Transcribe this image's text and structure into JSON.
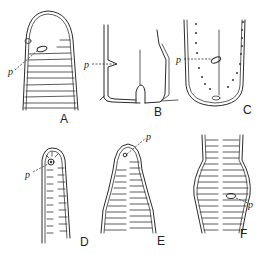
{
  "figure": {
    "panels": [
      {
        "id": "A",
        "label": "A",
        "pointer_label": "p",
        "description": "Rounded tip with transverse striations and pore p"
      },
      {
        "id": "B",
        "label": "B",
        "pointer_label": "p",
        "description": "Branching tube outline with pore p"
      },
      {
        "id": "C",
        "label": "C",
        "pointer_label": "p",
        "description": "U-shaped tip with dotted rows and pore p"
      },
      {
        "id": "D",
        "label": "D",
        "pointer_label": "p",
        "description": "Narrow tip with short striations and pore p"
      },
      {
        "id": "E",
        "label": "E",
        "pointer_label": "p",
        "description": "Flared tip with striations and pore p"
      },
      {
        "id": "F",
        "label": "F",
        "pointer_label": "p",
        "description": "Swollen segment with striations and pore p"
      }
    ],
    "colors": {
      "ink": "#2a2a2a",
      "background": "#ffffff"
    }
  }
}
